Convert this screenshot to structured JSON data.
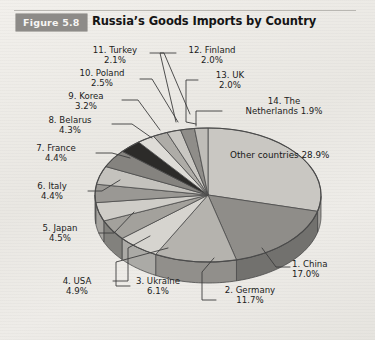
{
  "header": {
    "figure_badge": "Figure 5.8",
    "title": "Russia’s Goods Imports by Country"
  },
  "colors": {
    "page_background": "#edebe7",
    "badge_background": "#8d8b88",
    "badge_text": "#f6f5f3",
    "title_text": "#151515",
    "outline": "#4a4a4a",
    "leader_line": "#3d3d3d"
  },
  "labels": {
    "other": {
      "name": "Other countries",
      "value": "28.9%"
    },
    "china": {
      "name": "1. China",
      "value": "17.0%"
    },
    "germany": {
      "name": "2. Germany",
      "value": "11.7%"
    },
    "ukraine": {
      "name": "3. Ukraine",
      "value": "6.1%"
    },
    "usa": {
      "name": "4. USA",
      "value": "4.9%"
    },
    "japan": {
      "name": "5. Japan",
      "value": "4.5%"
    },
    "italy": {
      "name": "6. Italy",
      "value": "4.4%"
    },
    "france": {
      "name": "7. France",
      "value": "4.4%"
    },
    "belarus": {
      "name": "8. Belarus",
      "value": "4.3%"
    },
    "korea": {
      "name": "9. Korea",
      "value": "3.2%"
    },
    "poland": {
      "name": "10. Poland",
      "value": "2.5%"
    },
    "turkey": {
      "name": "11. Turkey",
      "value": "2.1%"
    },
    "finland": {
      "name": "12. Finland",
      "value": "2.0%"
    },
    "uk": {
      "name": "13. UK",
      "value": "2.0%"
    },
    "netherlands_line1": {
      "name": "14. The",
      "value": "Netherlands 1.9%"
    }
  },
  "chart_data": {
    "type": "pie",
    "title": "Russia’s Goods Imports by Country",
    "subtitle": "Figure 5.8",
    "xlabel": "",
    "ylabel": "",
    "units": "percent of total goods imports",
    "three_d": true,
    "legend": "none (direct labels with leader lines)",
    "grid": false,
    "start_angle_deg": -90,
    "direction": "clockwise",
    "categories": [
      "Other countries",
      "1. China",
      "2. Germany",
      "3. Ukraine",
      "4. USA",
      "5. Japan",
      "6. Italy",
      "7. France",
      "8. Belarus",
      "9. Korea",
      "10. Poland",
      "11. Turkey",
      "12. Finland",
      "13. UK",
      "14. The Netherlands"
    ],
    "values": [
      28.9,
      17.0,
      11.7,
      6.1,
      4.9,
      4.5,
      4.4,
      4.4,
      4.3,
      3.2,
      2.5,
      2.1,
      2.0,
      2.0,
      1.9
    ],
    "slice_fills": [
      "#c9c7c2",
      "#8f8d89",
      "#b5b3ae",
      "#d6d4cf",
      "#a3a19c",
      "#cfcdc8",
      "#9a9894",
      "#c4c2bd",
      "#85837f",
      "#2c2b29",
      "#dedcd7",
      "#aeaca7",
      "#c9c7c2",
      "#8f8d89",
      "#bfbdb8"
    ]
  }
}
